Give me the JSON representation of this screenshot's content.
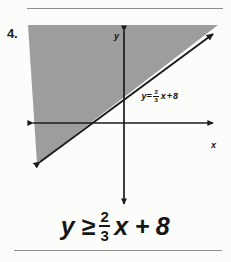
{
  "problem": {
    "number": "4."
  },
  "graph": {
    "axis_labels": {
      "x": "x",
      "y": "y"
    },
    "line_label": {
      "lhs": "y=",
      "numerator": "2",
      "denominator": "3",
      "variable": "x",
      "plus": "+",
      "intercept": "8"
    },
    "shading": {
      "color": "#9a9a9a",
      "description": "region-above-line"
    },
    "line_color": "#1c1c1c",
    "axis_color": "#1c1c1c"
  },
  "answer": {
    "variable": "y",
    "relation": "≥",
    "numerator": "2",
    "denominator": "3",
    "x_variable": "x",
    "plus": "+",
    "intercept": "8"
  }
}
